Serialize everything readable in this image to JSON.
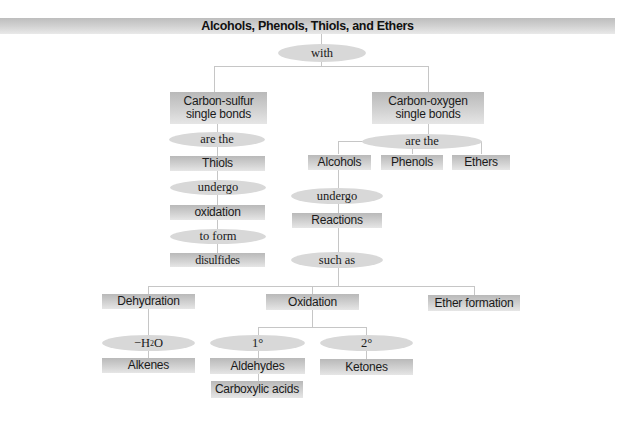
{
  "diagram": {
    "title": "Alcohols, Phenols, Thiols, and Ethers",
    "root_link": "with",
    "left_branch": {
      "category": "Carbon-sulfur single bonds",
      "category_line1": "Carbon-sulfur",
      "category_line2": "single bonds",
      "link1": "are the",
      "compound": "Thiols",
      "link2": "undergo",
      "reaction": "oxidation",
      "link3": "to form",
      "product": "disulfides"
    },
    "right_branch": {
      "category": "Carbon-oxygen single bonds",
      "category_line1": "Carbon-oxygen",
      "category_line2": "single bonds",
      "link1": "are the",
      "compounds": [
        "Alcohols",
        "Phenols",
        "Ethers"
      ],
      "alcohol_link": "undergo",
      "reactions": "Reactions",
      "reactions_link": "such as",
      "reaction_types": [
        "Dehydration",
        "Oxidation",
        "Ether formation"
      ],
      "dehydration": {
        "condition": "−H",
        "condition_sub": "2",
        "condition_tail": "O",
        "product": "Alkenes"
      },
      "oxidation": {
        "primary": {
          "label": "1°",
          "products": [
            "Aldehydes",
            "Carboxylic acids"
          ]
        },
        "secondary": {
          "label": "2°",
          "products": [
            "Ketones"
          ]
        }
      }
    }
  },
  "colors": {
    "box_fill": "#cfcfcf",
    "oval_fill": "#d8d8d8",
    "connector": "#c6c6c6",
    "text": "#1a1a1a"
  }
}
